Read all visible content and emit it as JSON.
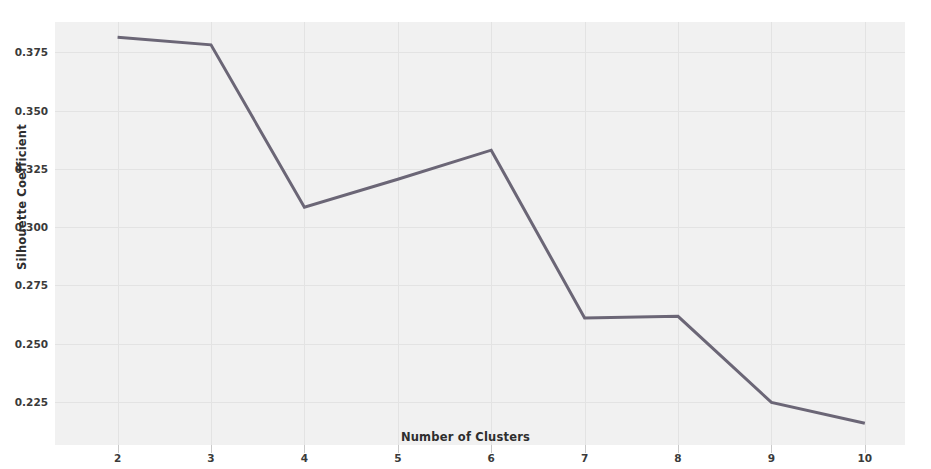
{
  "chart_data": {
    "type": "line",
    "title": "",
    "xlabel": "Number of Clusters",
    "ylabel": "Silhouette Coefficient",
    "x": [
      2,
      3,
      4,
      5,
      6,
      7,
      8,
      9,
      10
    ],
    "xticklabels": [
      "2",
      "3",
      "4",
      "5",
      "6",
      "7",
      "8",
      "9",
      "10"
    ],
    "yticks": [
      0.225,
      0.25,
      0.275,
      0.3,
      0.325,
      0.35,
      0.375
    ],
    "yticklabels": [
      "0.225",
      "0.250",
      "0.275",
      "0.300",
      "0.325",
      "0.350",
      "0.375"
    ],
    "series": [
      {
        "name": "Silhouette Coefficient",
        "values": [
          0.3815,
          0.3782,
          0.3085,
          0.3205,
          0.333,
          0.261,
          0.2617,
          0.2248,
          0.2158
        ],
        "color": "#6b6676",
        "linewidth": 3
      }
    ],
    "xlim": [
      1.33,
      10.43
    ],
    "ylim": [
      0.2065,
      0.388
    ],
    "grid": true,
    "legend": false,
    "legend_position": "none",
    "plot_background": "#f1f1f1",
    "figure_background": "#ffffff",
    "gridline_color": "#e3e3e3"
  }
}
